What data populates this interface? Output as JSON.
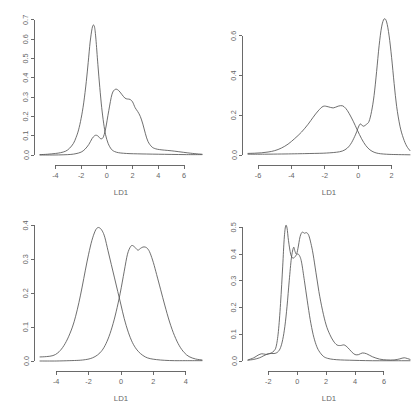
{
  "figure": {
    "background": "#ffffff",
    "line_color": "#555555",
    "text_color": "#666666",
    "layout": "2x2 grid of kernel density plots"
  },
  "chart_data": [
    {
      "id": "top-left",
      "type": "line",
      "title": "",
      "xlabel": "LD1",
      "ylabel": "",
      "xlim": [
        -5.2,
        7.4
      ],
      "ylim": [
        0.0,
        0.72
      ],
      "xticks": [
        -4,
        -2,
        0,
        2,
        4,
        6
      ],
      "xticklabels": [
        "-4",
        "-2",
        "0",
        "2",
        "4",
        "6"
      ],
      "yticks": [
        0.0,
        0.1,
        0.2,
        0.3,
        0.4,
        0.5,
        0.6,
        0.7
      ],
      "yticklabels": [
        "0.0",
        "0.1",
        "0.2",
        "0.3",
        "0.4",
        "0.5",
        "0.6",
        "0.7"
      ],
      "grid": false,
      "legend": "none",
      "series": [
        {
          "name": "group-1",
          "x": [
            -5.2,
            -4.6,
            -4.0,
            -3.6,
            -3.2,
            -2.9,
            -2.6,
            -2.4,
            -2.2,
            -2.0,
            -1.8,
            -1.6,
            -1.45,
            -1.3,
            -1.15,
            -1.05,
            -0.95,
            -0.85,
            -0.7,
            -0.55,
            -0.4,
            -0.25,
            -0.1,
            0.1,
            0.35,
            0.6,
            0.9,
            1.3,
            1.8,
            2.4,
            3.1,
            4.0,
            5.0,
            6.2,
            7.4
          ],
          "y": [
            0.002,
            0.004,
            0.008,
            0.012,
            0.02,
            0.035,
            0.06,
            0.09,
            0.13,
            0.19,
            0.27,
            0.38,
            0.48,
            0.585,
            0.655,
            0.673,
            0.66,
            0.6,
            0.47,
            0.35,
            0.245,
            0.165,
            0.105,
            0.06,
            0.03,
            0.018,
            0.012,
            0.009,
            0.007,
            0.006,
            0.005,
            0.004,
            0.003,
            0.002,
            0.002
          ]
        },
        {
          "name": "group-2",
          "x": [
            -5.2,
            -4.2,
            -3.4,
            -2.8,
            -2.4,
            -2.0,
            -1.7,
            -1.4,
            -1.15,
            -0.95,
            -0.8,
            -0.65,
            -0.5,
            -0.3,
            -0.1,
            0.15,
            0.4,
            0.65,
            0.9,
            1.15,
            1.4,
            1.6,
            1.8,
            2.0,
            2.2,
            2.4,
            2.6,
            2.8,
            3.0,
            3.2,
            3.5,
            3.8,
            4.1,
            4.5,
            5.0,
            5.6,
            6.3,
            7.0,
            7.4
          ],
          "y": [
            0.0,
            0.0,
            0.001,
            0.003,
            0.007,
            0.015,
            0.03,
            0.055,
            0.085,
            0.1,
            0.102,
            0.096,
            0.085,
            0.09,
            0.135,
            0.23,
            0.315,
            0.34,
            0.335,
            0.315,
            0.295,
            0.29,
            0.288,
            0.275,
            0.245,
            0.225,
            0.2,
            0.16,
            0.11,
            0.07,
            0.042,
            0.032,
            0.028,
            0.025,
            0.022,
            0.017,
            0.011,
            0.006,
            0.004
          ]
        }
      ]
    },
    {
      "id": "top-right",
      "type": "line",
      "title": "",
      "xlabel": "LD1",
      "ylabel": "",
      "xlim": [
        -6.6,
        3.1
      ],
      "ylim": [
        0.0,
        0.7
      ],
      "xticks": [
        -6,
        -4,
        -2,
        0,
        2
      ],
      "xticklabels": [
        "-6",
        "-4",
        "-2",
        "0",
        "2"
      ],
      "yticks": [
        0.0,
        0.2,
        0.4,
        0.6
      ],
      "yticklabels": [
        "0.0",
        "0.2",
        "0.4",
        "0.6"
      ],
      "grid": false,
      "legend": "none",
      "series": [
        {
          "name": "group-1",
          "x": [
            -6.6,
            -6.2,
            -5.8,
            -5.4,
            -5.0,
            -4.6,
            -4.2,
            -3.8,
            -3.4,
            -3.0,
            -2.7,
            -2.4,
            -2.1,
            -1.8,
            -1.5,
            -1.2,
            -0.95,
            -0.75,
            -0.55,
            -0.3,
            -0.05,
            0.2,
            0.45,
            0.7,
            0.95,
            1.2,
            1.5,
            1.9,
            2.4,
            3.1
          ],
          "y": [
            0.008,
            0.009,
            0.011,
            0.015,
            0.022,
            0.035,
            0.055,
            0.083,
            0.115,
            0.155,
            0.19,
            0.222,
            0.245,
            0.243,
            0.237,
            0.246,
            0.248,
            0.235,
            0.21,
            0.17,
            0.125,
            0.082,
            0.048,
            0.026,
            0.014,
            0.008,
            0.005,
            0.003,
            0.002,
            0.001
          ]
        },
        {
          "name": "group-2",
          "x": [
            -6.6,
            -5.6,
            -4.6,
            -3.8,
            -3.2,
            -2.6,
            -2.1,
            -1.7,
            -1.3,
            -0.95,
            -0.65,
            -0.4,
            -0.15,
            0.1,
            0.3,
            0.5,
            0.65,
            0.8,
            0.95,
            1.1,
            1.25,
            1.4,
            1.55,
            1.7,
            1.85,
            2.0,
            2.15,
            2.3,
            2.5,
            2.7,
            2.9,
            3.1
          ],
          "y": [
            0.004,
            0.004,
            0.005,
            0.006,
            0.007,
            0.008,
            0.009,
            0.011,
            0.014,
            0.02,
            0.035,
            0.062,
            0.105,
            0.155,
            0.145,
            0.155,
            0.17,
            0.22,
            0.3,
            0.42,
            0.55,
            0.645,
            0.685,
            0.67,
            0.6,
            0.49,
            0.36,
            0.245,
            0.145,
            0.085,
            0.045,
            0.022
          ]
        }
      ]
    },
    {
      "id": "bottom-left",
      "type": "line",
      "title": "",
      "xlabel": "LD1",
      "ylabel": "",
      "xlim": [
        -5.0,
        5.0
      ],
      "ylim": [
        0.0,
        0.41
      ],
      "xticks": [
        -4,
        -2,
        0,
        2,
        4
      ],
      "xticklabels": [
        "-4",
        "-2",
        "0",
        "2",
        "4"
      ],
      "yticks": [
        0.0,
        0.1,
        0.2,
        0.3,
        0.4
      ],
      "yticklabels": [
        "0.0",
        "0.1",
        "0.2",
        "0.3",
        "0.4"
      ],
      "grid": false,
      "legend": "none",
      "series": [
        {
          "name": "group-1",
          "x": [
            -5.0,
            -4.6,
            -4.2,
            -3.9,
            -3.6,
            -3.3,
            -3.0,
            -2.8,
            -2.6,
            -2.4,
            -2.2,
            -2.0,
            -1.8,
            -1.6,
            -1.45,
            -1.3,
            -1.15,
            -1.0,
            -0.8,
            -0.6,
            -0.4,
            -0.2,
            0.0,
            0.2,
            0.45,
            0.7,
            0.95,
            1.2,
            1.5,
            1.8,
            2.2,
            2.7,
            3.3,
            4.0,
            5.0
          ],
          "y": [
            0.012,
            0.013,
            0.016,
            0.024,
            0.04,
            0.065,
            0.1,
            0.132,
            0.172,
            0.218,
            0.268,
            0.315,
            0.355,
            0.383,
            0.393,
            0.392,
            0.383,
            0.365,
            0.325,
            0.285,
            0.245,
            0.205,
            0.165,
            0.125,
            0.085,
            0.055,
            0.035,
            0.022,
            0.012,
            0.007,
            0.004,
            0.002,
            0.001,
            0.001,
            0.001
          ]
        },
        {
          "name": "group-2",
          "x": [
            -5.0,
            -4.0,
            -3.2,
            -2.6,
            -2.2,
            -1.9,
            -1.6,
            -1.3,
            -1.05,
            -0.8,
            -0.55,
            -0.3,
            -0.05,
            0.2,
            0.4,
            0.6,
            0.75,
            0.9,
            1.05,
            1.2,
            1.35,
            1.5,
            1.65,
            1.8,
            2.0,
            2.2,
            2.45,
            2.7,
            3.0,
            3.3,
            3.6,
            3.9,
            4.2,
            4.6,
            5.0
          ],
          "y": [
            0.0,
            0.0,
            0.001,
            0.002,
            0.004,
            0.007,
            0.013,
            0.024,
            0.04,
            0.065,
            0.1,
            0.145,
            0.2,
            0.265,
            0.315,
            0.338,
            0.34,
            0.333,
            0.327,
            0.332,
            0.336,
            0.336,
            0.331,
            0.318,
            0.29,
            0.255,
            0.21,
            0.165,
            0.115,
            0.075,
            0.045,
            0.025,
            0.013,
            0.006,
            0.003
          ]
        }
      ]
    },
    {
      "id": "bottom-right",
      "type": "line",
      "title": "",
      "xlabel": "LD1",
      "ylabel": "",
      "xlim": [
        -3.4,
        7.8
      ],
      "ylim": [
        0.0,
        0.52
      ],
      "xticks": [
        -2,
        0,
        2,
        4,
        6
      ],
      "xticklabels": [
        "-2",
        "0",
        "2",
        "4",
        "6"
      ],
      "yticks": [
        0.0,
        0.1,
        0.2,
        0.3,
        0.4,
        0.5
      ],
      "yticklabels": [
        "0.0",
        "0.1",
        "0.2",
        "0.3",
        "0.4",
        "0.5"
      ],
      "grid": false,
      "legend": "none",
      "series": [
        {
          "name": "group-1",
          "x": [
            -3.4,
            -3.0,
            -2.7,
            -2.45,
            -2.2,
            -2.0,
            -1.8,
            -1.6,
            -1.45,
            -1.3,
            -1.15,
            -1.0,
            -0.9,
            -0.8,
            -0.7,
            -0.6,
            -0.45,
            -0.3,
            -0.15,
            0.0,
            0.15,
            0.3,
            0.5,
            0.7,
            0.9,
            1.1,
            1.3,
            1.5,
            1.8,
            2.1,
            2.5,
            3.0,
            3.6,
            4.3,
            5.2,
            6.2,
            7.0,
            7.8
          ],
          "y": [
            0.004,
            0.012,
            0.022,
            0.027,
            0.025,
            0.026,
            0.03,
            0.038,
            0.055,
            0.11,
            0.215,
            0.355,
            0.455,
            0.505,
            0.497,
            0.45,
            0.4,
            0.385,
            0.39,
            0.4,
            0.395,
            0.37,
            0.3,
            0.225,
            0.155,
            0.1,
            0.062,
            0.038,
            0.018,
            0.01,
            0.006,
            0.004,
            0.003,
            0.002,
            0.001,
            0.001,
            0.001,
            0.001
          ]
        },
        {
          "name": "group-2",
          "x": [
            -3.4,
            -3.0,
            -2.6,
            -2.3,
            -2.0,
            -1.8,
            -1.6,
            -1.45,
            -1.3,
            -1.15,
            -1.0,
            -0.85,
            -0.7,
            -0.55,
            -0.4,
            -0.25,
            -0.15,
            -0.05,
            0.05,
            0.2,
            0.35,
            0.5,
            0.65,
            0.8,
            0.95,
            1.1,
            1.3,
            1.5,
            1.75,
            2.0,
            2.25,
            2.5,
            2.75,
            3.0,
            3.25,
            3.5,
            3.75,
            4.0,
            4.25,
            4.5,
            4.8,
            5.2,
            5.7,
            6.2,
            6.7,
            7.1,
            7.4,
            7.8
          ],
          "y": [
            0.003,
            0.006,
            0.012,
            0.02,
            0.027,
            0.028,
            0.028,
            0.03,
            0.036,
            0.05,
            0.08,
            0.13,
            0.205,
            0.3,
            0.385,
            0.425,
            0.41,
            0.4,
            0.42,
            0.465,
            0.482,
            0.478,
            0.48,
            0.47,
            0.44,
            0.4,
            0.33,
            0.26,
            0.19,
            0.135,
            0.1,
            0.075,
            0.06,
            0.058,
            0.06,
            0.05,
            0.035,
            0.024,
            0.024,
            0.03,
            0.027,
            0.016,
            0.007,
            0.004,
            0.004,
            0.008,
            0.012,
            0.006
          ]
        }
      ]
    }
  ]
}
